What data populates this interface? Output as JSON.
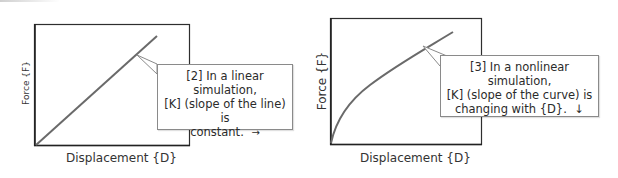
{
  "diagrams": [
    {
      "id": "linear",
      "x_axis_label": "Displacement {D}",
      "y_axis_label": "Force {F}",
      "curve_type": "straight line",
      "callout": {
        "line1": "[2] In a linear simulation,",
        "line2": "[K] (slope of the line) is",
        "line3": "constant.",
        "arrow": "→"
      }
    },
    {
      "id": "nonlinear",
      "x_axis_label": "Displacement {D}",
      "y_axis_label": "Force {F}",
      "curve_type": "concave-down curve",
      "callout": {
        "line1": "[3] In a nonlinear simulation,",
        "line2": "[K] (slope of the curve) is",
        "line3": "changing with {D}.",
        "arrow": "↓"
      }
    }
  ],
  "colors": {
    "frame": "#2e2e2e",
    "curve": "#6a6a6a",
    "callout_border": "#8a8a8a",
    "text": "#2b2b2b"
  }
}
